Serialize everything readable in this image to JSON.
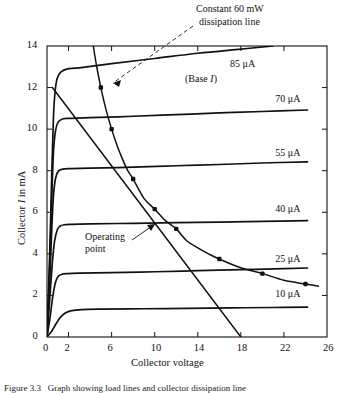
{
  "figure": {
    "caption": "Figure 3.3   Graph showing load lines and collector dissipation line",
    "background_color": "#ffffff",
    "ink_color": "#111111"
  },
  "chart_data": {
    "type": "line",
    "title": "",
    "xlabel": "Collector voltage",
    "ylabel": "Collector I in mA",
    "xlim": [
      0,
      26
    ],
    "ylim": [
      0,
      14
    ],
    "xticks": [
      0,
      2,
      6,
      10,
      14,
      18,
      22,
      26
    ],
    "xtick_labels": [
      "0",
      "2",
      "6",
      "10",
      "14",
      "18",
      "22",
      "26"
    ],
    "yticks": [
      0,
      2,
      4,
      6,
      8,
      10,
      12,
      14
    ],
    "ytick_labels": [
      "0",
      "2",
      "4",
      "6",
      "8",
      "10",
      "12",
      "14"
    ],
    "grid": false,
    "legend_position": "inline-right",
    "series": [
      {
        "name": "85 uA",
        "label": "85 μA",
        "kind": "characteristic-curve",
        "base_current_uA": 85,
        "saturation_mA": 12.9,
        "label_x": 17.0,
        "label_y": 13.15,
        "points": [
          [
            0.0,
            0.0
          ],
          [
            0.25,
            4.0
          ],
          [
            0.45,
            8.0
          ],
          [
            0.6,
            10.6
          ],
          [
            0.75,
            11.8
          ],
          [
            0.95,
            12.45
          ],
          [
            1.3,
            12.75
          ],
          [
            1.9,
            12.9
          ],
          [
            3.0,
            12.95
          ],
          [
            6.0,
            13.15
          ],
          [
            10.0,
            13.4
          ],
          [
            14.0,
            13.65
          ],
          [
            18.0,
            13.85
          ],
          [
            21.0,
            14.0
          ]
        ]
      },
      {
        "name": "70 uA",
        "label": "70 μA",
        "kind": "characteristic-curve",
        "base_current_uA": 70,
        "saturation_mA": 10.5,
        "label_x": 21.2,
        "label_y": 11.45,
        "points": [
          [
            0.0,
            0.0
          ],
          [
            0.25,
            3.4
          ],
          [
            0.45,
            6.8
          ],
          [
            0.6,
            8.9
          ],
          [
            0.8,
            9.95
          ],
          [
            1.05,
            10.35
          ],
          [
            1.5,
            10.5
          ],
          [
            2.2,
            10.52
          ],
          [
            4.0,
            10.55
          ],
          [
            8.0,
            10.62
          ],
          [
            12.0,
            10.7
          ],
          [
            16.0,
            10.78
          ],
          [
            20.0,
            10.85
          ],
          [
            24.2,
            10.92
          ]
        ]
      },
      {
        "name": "55 uA",
        "label": "55 μA",
        "kind": "characteristic-curve",
        "base_current_uA": 55,
        "saturation_mA": 8.1,
        "label_x": 21.2,
        "label_y": 8.85,
        "points": [
          [
            0.0,
            0.0
          ],
          [
            0.25,
            2.7
          ],
          [
            0.45,
            5.3
          ],
          [
            0.6,
            6.8
          ],
          [
            0.8,
            7.65
          ],
          [
            1.05,
            7.98
          ],
          [
            1.5,
            8.08
          ],
          [
            2.2,
            8.1
          ],
          [
            4.0,
            8.12
          ],
          [
            8.0,
            8.17
          ],
          [
            12.0,
            8.24
          ],
          [
            16.0,
            8.3
          ],
          [
            20.0,
            8.37
          ],
          [
            24.2,
            8.43
          ]
        ]
      },
      {
        "name": "40 uA",
        "label": "40 μA",
        "kind": "characteristic-curve",
        "base_current_uA": 40,
        "saturation_mA": 5.4,
        "label_x": 21.2,
        "label_y": 6.15,
        "points": [
          [
            0.0,
            0.0
          ],
          [
            0.25,
            1.8
          ],
          [
            0.5,
            3.6
          ],
          [
            0.7,
            4.6
          ],
          [
            0.95,
            5.15
          ],
          [
            1.2,
            5.33
          ],
          [
            1.6,
            5.4
          ],
          [
            2.3,
            5.42
          ],
          [
            4.0,
            5.44
          ],
          [
            8.0,
            5.47
          ],
          [
            12.0,
            5.5
          ],
          [
            16.0,
            5.53
          ],
          [
            20.0,
            5.56
          ],
          [
            24.2,
            5.6
          ]
        ]
      },
      {
        "name": "25 uA",
        "label": "25 μA",
        "kind": "characteristic-curve",
        "base_current_uA": 25,
        "saturation_mA": 3.05,
        "label_x": 21.2,
        "label_y": 3.75,
        "points": [
          [
            0.0,
            0.0
          ],
          [
            0.3,
            1.0
          ],
          [
            0.55,
            2.0
          ],
          [
            0.8,
            2.65
          ],
          [
            1.05,
            2.92
          ],
          [
            1.4,
            3.02
          ],
          [
            1.9,
            3.05
          ],
          [
            3.0,
            3.07
          ],
          [
            6.0,
            3.1
          ],
          [
            10.0,
            3.14
          ],
          [
            14.0,
            3.19
          ],
          [
            18.0,
            3.24
          ],
          [
            22.0,
            3.29
          ],
          [
            24.2,
            3.32
          ]
        ]
      },
      {
        "name": "10 uA",
        "label": "10 μA",
        "kind": "characteristic-curve",
        "base_current_uA": 10,
        "saturation_mA": 1.35,
        "label_x": 21.2,
        "label_y": 2.05,
        "points": [
          [
            0.0,
            0.0
          ],
          [
            0.4,
            0.25
          ],
          [
            0.8,
            0.6
          ],
          [
            1.2,
            0.92
          ],
          [
            1.7,
            1.15
          ],
          [
            2.3,
            1.27
          ],
          [
            3.2,
            1.32
          ],
          [
            5.0,
            1.34
          ],
          [
            9.0,
            1.36
          ],
          [
            13.0,
            1.38
          ],
          [
            17.0,
            1.4
          ],
          [
            21.0,
            1.42
          ],
          [
            24.2,
            1.44
          ]
        ]
      },
      {
        "name": "60 mW dissipation hyperbola",
        "label": "Constant 60 mW dissipation line",
        "kind": "dissipation-hyperbola",
        "power_mW": 60,
        "points": [
          [
            4.3,
            14.0
          ],
          [
            4.6,
            13.05
          ],
          [
            5.0,
            12.0
          ],
          [
            5.5,
            10.9
          ],
          [
            6.0,
            10.0
          ],
          [
            6.5,
            9.23
          ],
          [
            7.0,
            8.57
          ],
          [
            7.5,
            8.0
          ],
          [
            8.0,
            7.6
          ],
          [
            9.0,
            6.67
          ],
          [
            10.0,
            6.15
          ],
          [
            11.0,
            5.6
          ],
          [
            12.0,
            5.2
          ],
          [
            13.0,
            4.62
          ],
          [
            14.0,
            4.29
          ],
          [
            15.0,
            4.0
          ],
          [
            16.0,
            3.75
          ],
          [
            18.0,
            3.33
          ],
          [
            20.0,
            3.05
          ],
          [
            22.0,
            2.73
          ],
          [
            24.0,
            2.55
          ],
          [
            25.2,
            2.45
          ]
        ],
        "markers": [
          [
            5.0,
            12.0
          ],
          [
            6.0,
            10.0
          ],
          [
            8.0,
            7.6
          ],
          [
            10.0,
            6.15
          ],
          [
            12.0,
            5.2
          ],
          [
            16.0,
            3.75
          ],
          [
            20.0,
            3.05
          ],
          [
            24.0,
            2.55
          ]
        ]
      },
      {
        "name": "load line",
        "label": "Load line",
        "kind": "load-line",
        "points": [
          [
            0.5,
            12.0
          ],
          [
            18.0,
            0.0
          ]
        ]
      }
    ],
    "annotations": [
      {
        "name": "dissipation-line-annotation",
        "text_line1": "Constant 60 mW",
        "text_line2": "dissipation line",
        "text_x_px": 196,
        "text_y_px": 6,
        "arrow_from_px": [
          193,
          26
        ],
        "arrow_to_px": [
          113,
          83
        ],
        "style": "dashed-arrow"
      },
      {
        "name": "operating-point-annotation",
        "text_line1": "Operating",
        "text_line2": "point",
        "text_x_px": 88,
        "text_y_px": 238,
        "arrow_from_px": [
          132,
          240
        ],
        "arrow_to_px": [
          155,
          224
        ],
        "style": "solid-arrow"
      },
      {
        "name": "base-current-note",
        "text": "(Base I)",
        "text_x_px": 187,
        "text_y_px": 79
      }
    ],
    "operating_point": {
      "v": 10.0,
      "i": 5.45
    }
  }
}
